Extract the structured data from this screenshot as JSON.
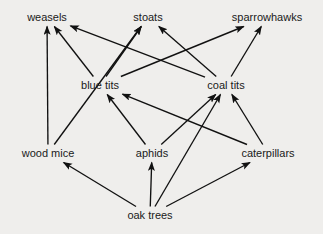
{
  "diagram": {
    "type": "food-web",
    "background_color": "#efeeec",
    "line_color": "#111111",
    "text_color": "#1a1a1a",
    "width": 323,
    "height": 234,
    "nodes": [
      {
        "id": "weasels",
        "label": "weasels",
        "x": 47,
        "y": 17,
        "trophic": "top-predator"
      },
      {
        "id": "stoats",
        "label": "stoats",
        "x": 148,
        "y": 17,
        "trophic": "top-predator"
      },
      {
        "id": "sparrowhawks",
        "label": "sparrowhawks",
        "x": 267,
        "y": 17,
        "trophic": "top-predator"
      },
      {
        "id": "blue_tits",
        "label": "blue tits",
        "x": 100,
        "y": 85,
        "trophic": "secondary-consumer"
      },
      {
        "id": "coal_tits",
        "label": "coal tits",
        "x": 226,
        "y": 85,
        "trophic": "secondary-consumer"
      },
      {
        "id": "wood_mice",
        "label": "wood mice",
        "x": 48,
        "y": 153,
        "trophic": "primary-consumer"
      },
      {
        "id": "aphids",
        "label": "aphids",
        "x": 152,
        "y": 153,
        "trophic": "primary-consumer"
      },
      {
        "id": "caterpillars",
        "label": "caterpillars",
        "x": 268,
        "y": 153,
        "trophic": "primary-consumer"
      },
      {
        "id": "oak_trees",
        "label": "oak trees",
        "x": 150,
        "y": 215,
        "trophic": "producer"
      }
    ],
    "edges": [
      {
        "from": "wood_mice",
        "to": "weasels",
        "label": "wood mice eaten by weasels"
      },
      {
        "from": "wood_mice",
        "to": "stoats",
        "label": "wood mice eaten by stoats"
      },
      {
        "from": "blue_tits",
        "to": "weasels",
        "label": "blue tits eaten by weasels"
      },
      {
        "from": "blue_tits",
        "to": "stoats",
        "label": "blue tits eaten by stoats"
      },
      {
        "from": "blue_tits",
        "to": "sparrowhawks",
        "label": "blue tits eaten by sparrowhawks"
      },
      {
        "from": "coal_tits",
        "to": "weasels",
        "label": "coal tits eaten by weasels"
      },
      {
        "from": "coal_tits",
        "to": "stoats",
        "label": "coal tits eaten by stoats"
      },
      {
        "from": "coal_tits",
        "to": "sparrowhawks",
        "label": "coal tits eaten by sparrowhawks"
      },
      {
        "from": "aphids",
        "to": "blue_tits",
        "label": "aphids eaten by blue tits"
      },
      {
        "from": "aphids",
        "to": "coal_tits",
        "label": "aphids eaten by coal tits"
      },
      {
        "from": "caterpillars",
        "to": "blue_tits",
        "label": "caterpillars eaten by blue tits"
      },
      {
        "from": "caterpillars",
        "to": "coal_tits",
        "label": "caterpillars eaten by coal tits"
      },
      {
        "from": "oak_trees",
        "to": "wood_mice",
        "label": "oak trees eaten by wood mice"
      },
      {
        "from": "oak_trees",
        "to": "aphids",
        "label": "oak trees eaten by aphids"
      },
      {
        "from": "oak_trees",
        "to": "caterpillars",
        "label": "oak trees eaten by caterpillars"
      },
      {
        "from": "oak_trees",
        "to": "coal_tits",
        "label": "oak trees eaten by coal tits"
      }
    ]
  }
}
